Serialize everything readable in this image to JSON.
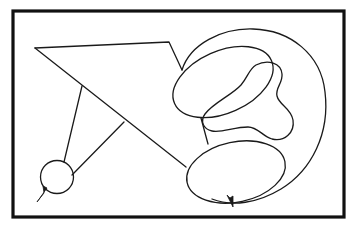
{
  "figure": {
    "background_color": "#ffffff",
    "ink_color": "#1a1a1a",
    "frame_color": "#111111",
    "canvas": {
      "width": 357,
      "height": 232
    },
    "frame": {
      "x": 13,
      "y": 11,
      "width": 331,
      "height": 206,
      "stroke_width": 3.2
    },
    "shapes": [
      {
        "id": "kite-polygon",
        "name": "kite-polygon",
        "type": "polyline",
        "points": "35,48 169,42 182,70"
      },
      {
        "id": "kite-long-diagonal",
        "name": "kite-long-diagonal",
        "type": "polyline",
        "points": "35,48 186,167"
      },
      {
        "id": "strut-upper",
        "name": "strut-upper-to-circle",
        "type": "polyline",
        "points": "82,86 64,162"
      },
      {
        "id": "strut-lower",
        "name": "strut-lower-to-circle",
        "type": "polyline",
        "points": "124,122 72,175"
      },
      {
        "id": "small-circle",
        "name": "small-circle",
        "type": "circle",
        "cx": 57,
        "cy": 177,
        "r": 16.5
      },
      {
        "id": "circle-spike",
        "name": "circle-spike",
        "type": "polygon",
        "points": "46,187 43,202 38,202 44,193"
      },
      {
        "id": "upper-ellipse",
        "name": "upper-ellipse",
        "type": "ellipse",
        "cx": 223,
        "cy": 82,
        "rx": 53,
        "ry": 31,
        "rotation": -24
      },
      {
        "id": "lower-ellipse",
        "name": "lower-ellipse",
        "type": "ellipse",
        "cx": 236,
        "cy": 172,
        "rx": 50,
        "ry": 30,
        "rotation": -12
      },
      {
        "id": "ellipse-connector",
        "name": "ellipse-connector-strut",
        "type": "polyline",
        "points": "201,118 208,144"
      },
      {
        "id": "lower-ellipse-spike",
        "name": "lower-ellipse-spike",
        "type": "polygon",
        "points": "228,196 232,206 235,196 231,199"
      },
      {
        "id": "outer-c-curve",
        "name": "outer-c-curve",
        "type": "open-curve"
      },
      {
        "id": "bone-blob",
        "name": "bone-blob",
        "type": "closed-blob"
      }
    ]
  }
}
